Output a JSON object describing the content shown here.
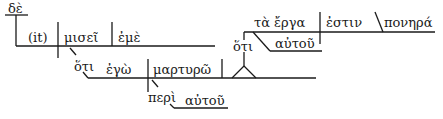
{
  "diagram": {
    "type": "sentence-diagram",
    "language": "Greek",
    "words": {
      "de": "δὲ",
      "it": "(it)",
      "misei": "μισεῖ",
      "eme": "ἐμὲ",
      "hoti_1": "ὅτι",
      "ego": "ἐγὼ",
      "martyro": "μαρτυρῶ",
      "peri": "περὶ",
      "autou_1": "αὐτοῦ",
      "hoti_2": "ὅτι",
      "ta_erga": "τὰ ἔργα",
      "estin": "ἐστιν",
      "ponera": "πονηρά",
      "autou_2": "αὐτοῦ"
    },
    "colors": {
      "line": "#1a1a1a",
      "background": "#ffffff"
    }
  }
}
